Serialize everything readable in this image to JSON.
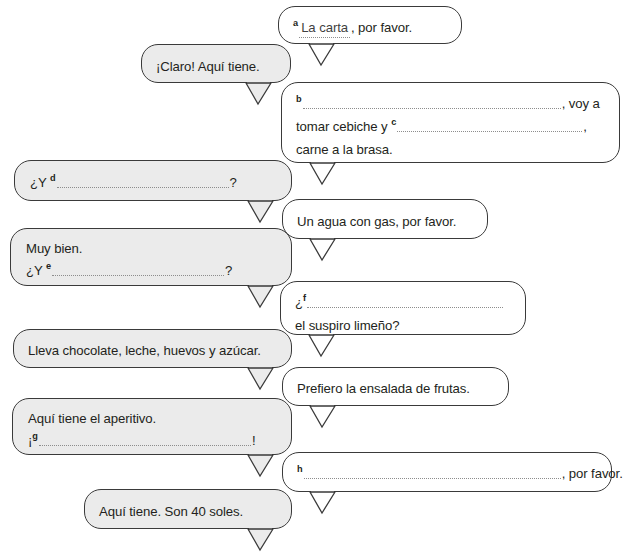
{
  "exercise": {
    "type": "fill-in-the-blank-dialogue",
    "language": "Spanish",
    "scene": "restaurant-order-dialogue"
  },
  "bubbles": [
    {
      "id": "bubble-a",
      "side": "right",
      "fill": "white",
      "lines": [
        {
          "segments": [
            {
              "kind": "key",
              "text": "a"
            },
            {
              "kind": "blank-filled",
              "text": "La carta"
            },
            {
              "kind": "text",
              "text": ", por favor."
            }
          ]
        }
      ]
    },
    {
      "id": "bubble-claro",
      "side": "left",
      "fill": "gray",
      "lines": [
        {
          "segments": [
            {
              "kind": "text",
              "text": "¡Claro! Aquí tiene."
            }
          ]
        }
      ]
    },
    {
      "id": "bubble-b",
      "side": "right",
      "fill": "white",
      "lines": [
        {
          "segments": [
            {
              "kind": "key",
              "text": "b"
            },
            {
              "kind": "blank",
              "text": ""
            },
            {
              "kind": "text",
              "text": ", voy a"
            }
          ]
        },
        {
          "segments": [
            {
              "kind": "text",
              "text": "tomar cebiche y "
            },
            {
              "kind": "key",
              "text": "c"
            },
            {
              "kind": "blank",
              "text": ""
            },
            {
              "kind": "text",
              "text": ","
            }
          ]
        },
        {
          "segments": [
            {
              "kind": "text",
              "text": "carne a la brasa."
            }
          ]
        }
      ]
    },
    {
      "id": "bubble-d",
      "side": "left",
      "fill": "gray",
      "lines": [
        {
          "segments": [
            {
              "kind": "text",
              "text": "¿Y "
            },
            {
              "kind": "key",
              "text": "d"
            },
            {
              "kind": "blank",
              "text": ""
            },
            {
              "kind": "text",
              "text": "?"
            }
          ]
        }
      ]
    },
    {
      "id": "bubble-agua",
      "side": "right",
      "fill": "white",
      "lines": [
        {
          "segments": [
            {
              "kind": "text",
              "text": "Un agua con gas, por favor."
            }
          ]
        }
      ]
    },
    {
      "id": "bubble-e",
      "side": "left",
      "fill": "gray",
      "lines": [
        {
          "segments": [
            {
              "kind": "text",
              "text": "Muy bien."
            }
          ]
        },
        {
          "segments": [
            {
              "kind": "text",
              "text": "¿Y "
            },
            {
              "kind": "key",
              "text": "e"
            },
            {
              "kind": "blank",
              "text": ""
            },
            {
              "kind": "text",
              "text": "?"
            }
          ]
        }
      ]
    },
    {
      "id": "bubble-f",
      "side": "right",
      "fill": "white",
      "lines": [
        {
          "segments": [
            {
              "kind": "text",
              "text": "¿"
            },
            {
              "kind": "key",
              "text": "f"
            },
            {
              "kind": "blank",
              "text": ""
            }
          ]
        },
        {
          "segments": [
            {
              "kind": "text",
              "text": "el suspiro limeño?"
            }
          ]
        }
      ]
    },
    {
      "id": "bubble-lleva",
      "side": "left",
      "fill": "gray",
      "lines": [
        {
          "segments": [
            {
              "kind": "text",
              "text": "Lleva chocolate, leche, huevos y azúcar."
            }
          ]
        }
      ]
    },
    {
      "id": "bubble-prefiero",
      "side": "right",
      "fill": "white",
      "lines": [
        {
          "segments": [
            {
              "kind": "text",
              "text": "Prefiero la ensalada de frutas."
            }
          ]
        }
      ]
    },
    {
      "id": "bubble-g",
      "side": "left",
      "fill": "gray",
      "lines": [
        {
          "segments": [
            {
              "kind": "text",
              "text": "Aquí tiene el aperitivo."
            }
          ]
        },
        {
          "segments": [
            {
              "kind": "text",
              "text": "¡"
            },
            {
              "kind": "key",
              "text": "g"
            },
            {
              "kind": "blank",
              "text": ""
            },
            {
              "kind": "text",
              "text": "!"
            }
          ]
        }
      ]
    },
    {
      "id": "bubble-h",
      "side": "right",
      "fill": "white",
      "lines": [
        {
          "segments": [
            {
              "kind": "key",
              "text": "h"
            },
            {
              "kind": "blank",
              "text": ""
            },
            {
              "kind": "text",
              "text": ", por favor."
            }
          ]
        }
      ]
    },
    {
      "id": "bubble-soles",
      "side": "left",
      "fill": "gray",
      "lines": [
        {
          "segments": [
            {
              "kind": "text",
              "text": "Aquí tiene. Son 40 soles."
            }
          ]
        }
      ]
    }
  ],
  "colors": {
    "bubble_stroke": "#3a3a3a",
    "bubble_fill_left": "#ebebeb",
    "bubble_fill_right": "#ffffff",
    "text": "#231f20",
    "blank_dots": "#8d8d8d",
    "page_background": "#ffffff"
  }
}
